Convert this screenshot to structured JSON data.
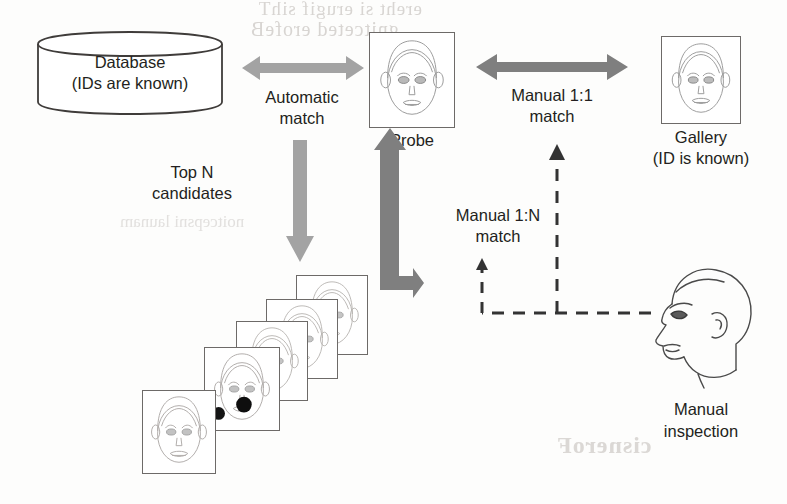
{
  "diagram": {
    "colors": {
      "text": "#231f20",
      "arrow_light": "#a0a0a0",
      "arrow_dark": "#7b7b7b",
      "outline": "#6d6a68",
      "dashed": "#3a3a3a",
      "ghost": "#d8d5d2"
    },
    "nodes": {
      "database": {
        "line1": "Database",
        "line2": "(IDs are known)",
        "shape": "cylinder"
      },
      "probe": {
        "caption": "Probe",
        "shape": "face-card"
      },
      "gallery": {
        "line1": "Gallery",
        "line2": "(ID is known)",
        "shape": "face-card"
      },
      "candidates": {
        "caption": "",
        "shape": "face-card-stack",
        "count": 5
      },
      "inspector": {
        "line1": "Manual",
        "line2": "inspection",
        "shape": "profile-head"
      }
    },
    "edges": {
      "automatic_match": {
        "line1": "Automatic",
        "line2": "match",
        "style": "double-headed-arrow",
        "from": "database",
        "to": "probe"
      },
      "top_n": {
        "line1": "Top N",
        "line2": "candidates",
        "style": "down-arrow",
        "from": "database",
        "to": "candidates"
      },
      "manual_1_1": {
        "line1": "Manual 1:1",
        "line2": "match",
        "style": "double-headed-arrow",
        "from": "probe",
        "to": "gallery"
      },
      "manual_1_n": {
        "line1": "Manual 1:N",
        "line2": "match",
        "style": "dashed-arrow",
        "from": "inspector",
        "to": "candidates"
      },
      "candidates_to_probe": {
        "label": "",
        "style": "elbow-arrow",
        "from": "candidates",
        "to": "probe"
      }
    },
    "ghost_text": {
      "top_line_1": "ereht si erugif sihT",
      "top_line_2": "gnitceted  erofeB",
      "bottom": "cisneroF",
      "mid": "noitcepsni launam"
    }
  }
}
